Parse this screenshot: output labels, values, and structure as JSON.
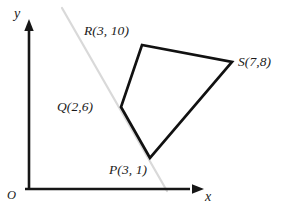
{
  "figure": {
    "background_color": "#ffffff",
    "stroke_color": "#111111",
    "guide_color": "#d9d9d9",
    "axis_color": "#161616"
  },
  "axes": {
    "x_label": "x",
    "y_label": "y",
    "origin_label": "O",
    "x_axis": {
      "x1": 25,
      "y1": 189,
      "x2": 198,
      "y2": 189
    },
    "y_axis": {
      "x1": 29,
      "y1": 190,
      "x2": 29,
      "y2": 27
    }
  },
  "guide": {
    "name": "light-gray-diagonal-line",
    "x1": 62,
    "y1": 8,
    "x2": 167,
    "y2": 191,
    "color": "#d9d9d9"
  },
  "chart_data": {
    "type": "scatter",
    "xlabel": "x",
    "ylabel": "y",
    "grid": false,
    "legend": false,
    "origin_label": "O",
    "points": [
      {
        "name": "P",
        "label": "P(3, 1)",
        "x": 3,
        "y": 1,
        "px": 150,
        "py": 158
      },
      {
        "name": "Q",
        "label": "Q(2,6)",
        "x": 2,
        "y": 6,
        "px": 121,
        "py": 107
      },
      {
        "name": "R",
        "label": "R(3, 10)",
        "x": 3,
        "y": 10,
        "px": 142,
        "py": 45
      },
      {
        "name": "S",
        "label": "S(7,8)",
        "x": 7,
        "y": 8,
        "px": 232,
        "py": 62
      }
    ],
    "polygon_order": [
      "P",
      "Q",
      "R",
      "S"
    ],
    "polygon_points_px": "150,158 121,107 142,45 232,62",
    "closed": true
  },
  "labels": {
    "P": "P(3, 1)",
    "Q": "Q(2,6)",
    "R": "R(3, 10)",
    "S": "S(7,8)"
  }
}
